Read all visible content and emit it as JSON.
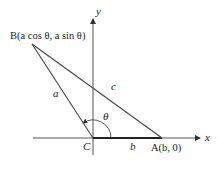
{
  "figure": {
    "axes": {
      "x_label": "x",
      "y_label": "y"
    },
    "points": {
      "B": {
        "label": "B(a cos θ, a sin θ)"
      },
      "C": {
        "label": "C"
      },
      "A": {
        "label": "A(b, 0)"
      }
    },
    "sides": {
      "a": "a",
      "b": "b",
      "c": "c"
    },
    "angle": {
      "label": "θ"
    },
    "colors": {
      "line": "#333333",
      "axis": "#555555",
      "background": "#ffffff"
    }
  }
}
